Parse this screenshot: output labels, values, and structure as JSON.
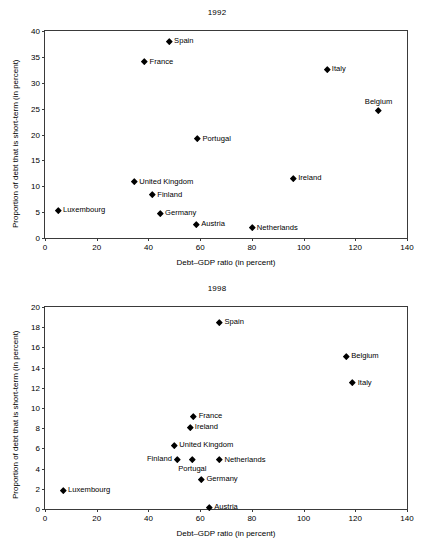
{
  "chart_data": [
    {
      "type": "scatter",
      "title": "1992",
      "xlabel": "Debt–GDP ratio (in percent)",
      "ylabel": "Proportion of debt that is short-term (in percent)",
      "xlim": [
        0,
        140
      ],
      "ylim": [
        0,
        40
      ],
      "xticks": [
        0,
        20,
        40,
        60,
        80,
        100,
        120,
        140
      ],
      "yticks": [
        0,
        5,
        10,
        15,
        20,
        25,
        30,
        35,
        40
      ],
      "grid": false,
      "legend": "none",
      "points": [
        {
          "label": "Spain",
          "x": 48.0,
          "y": 38.0,
          "label_pos": "right"
        },
        {
          "label": "France",
          "x": 38.5,
          "y": 34.1,
          "label_pos": "right"
        },
        {
          "label": "Italy",
          "x": 109.0,
          "y": 32.6,
          "label_pos": "right"
        },
        {
          "label": "Belgium",
          "x": 129.0,
          "y": 24.6,
          "label_pos": "above"
        },
        {
          "label": "Portugal",
          "x": 59.0,
          "y": 19.2,
          "label_pos": "right"
        },
        {
          "label": "Ireland",
          "x": 96.0,
          "y": 11.5,
          "label_pos": "right"
        },
        {
          "label": "United Kingdom",
          "x": 34.5,
          "y": 10.9,
          "label_pos": "right"
        },
        {
          "label": "Finland",
          "x": 41.5,
          "y": 8.4,
          "label_pos": "right"
        },
        {
          "label": "Luxembourg",
          "x": 5.0,
          "y": 5.4,
          "label_pos": "right"
        },
        {
          "label": "Germany",
          "x": 44.5,
          "y": 4.8,
          "label_pos": "right"
        },
        {
          "label": "Austria",
          "x": 58.5,
          "y": 2.7,
          "label_pos": "right"
        },
        {
          "label": "Netherlands",
          "x": 80.0,
          "y": 2.0,
          "label_pos": "right"
        }
      ]
    },
    {
      "type": "scatter",
      "title": "1998",
      "xlabel": "Debt–GDP ratio (in percent)",
      "ylabel": "Proportion of debt that is short-term (in percent)",
      "xlim": [
        0,
        140
      ],
      "ylim": [
        0,
        20
      ],
      "xticks": [
        0,
        20,
        40,
        60,
        80,
        100,
        120,
        140
      ],
      "yticks": [
        0,
        2,
        4,
        6,
        8,
        10,
        12,
        14,
        16,
        18,
        20
      ],
      "grid": false,
      "legend": "none",
      "points": [
        {
          "label": "Spain",
          "x": 67.5,
          "y": 18.5,
          "label_pos": "right"
        },
        {
          "label": "Belgium",
          "x": 116.5,
          "y": 15.1,
          "label_pos": "right"
        },
        {
          "label": "Italy",
          "x": 119.0,
          "y": 12.5,
          "label_pos": "right"
        },
        {
          "label": "France",
          "x": 57.5,
          "y": 9.2,
          "label_pos": "right"
        },
        {
          "label": "Ireland",
          "x": 56.0,
          "y": 8.1,
          "label_pos": "right"
        },
        {
          "label": "United Kingdom",
          "x": 50.0,
          "y": 6.3,
          "label_pos": "right"
        },
        {
          "label": "Finland",
          "x": 51.0,
          "y": 4.95,
          "label_pos": "left"
        },
        {
          "label": "Portugal",
          "x": 57.0,
          "y": 4.9,
          "label_pos": "below"
        },
        {
          "label": "Netherlands",
          "x": 67.5,
          "y": 4.9,
          "label_pos": "right"
        },
        {
          "label": "Germany",
          "x": 60.5,
          "y": 2.95,
          "label_pos": "right"
        },
        {
          "label": "Luxembourg",
          "x": 7.0,
          "y": 1.85,
          "label_pos": "right"
        },
        {
          "label": "Austria",
          "x": 63.5,
          "y": 0.2,
          "label_pos": "right"
        }
      ]
    }
  ]
}
